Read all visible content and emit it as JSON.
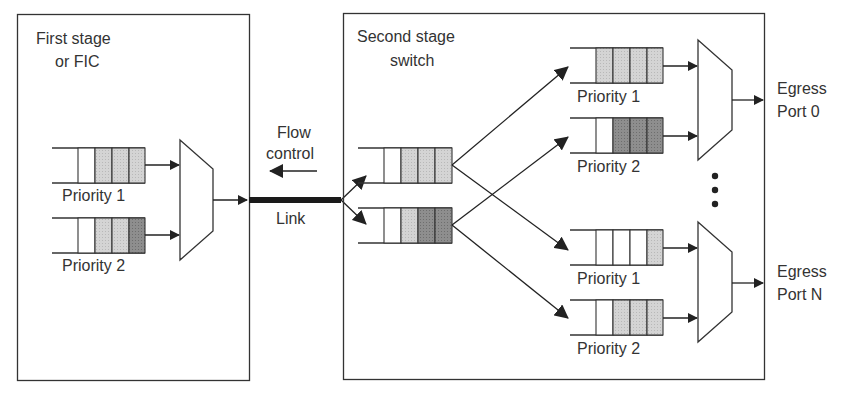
{
  "diagram": {
    "first_stage": {
      "title_line1": "First stage",
      "title_line2": "or FIC",
      "queues": [
        {
          "label": "Priority 1",
          "cells": [
            "empty",
            "light",
            "light",
            "light"
          ]
        },
        {
          "label": "Priority 2",
          "cells": [
            "empty",
            "light",
            "light",
            "dark"
          ]
        }
      ]
    },
    "link": {
      "flow_control_line1": "Flow",
      "flow_control_line2": "control",
      "link_label": "Link"
    },
    "second_stage": {
      "title_line1": "Second stage",
      "title_line2": "switch",
      "input_queues": [
        {
          "cells": [
            "empty",
            "light",
            "light",
            "light"
          ]
        },
        {
          "cells": [
            "empty",
            "light",
            "dark",
            "dark"
          ]
        }
      ],
      "output_groups": [
        {
          "port_label_line1": "Egress",
          "port_label_line2": "Port 0",
          "queues": [
            {
              "label": "Priority 1",
              "cells": [
                "light",
                "light",
                "light",
                "light"
              ]
            },
            {
              "label": "Priority 2",
              "cells": [
                "empty",
                "dark",
                "dark",
                "dark"
              ]
            }
          ]
        },
        {
          "port_label_line1": "Egress",
          "port_label_line2": "Port N",
          "queues": [
            {
              "label": "Priority 1",
              "cells": [
                "empty",
                "empty",
                "empty",
                "light"
              ]
            },
            {
              "label": "Priority 2",
              "cells": [
                "empty",
                "light",
                "light",
                "light"
              ]
            }
          ]
        }
      ],
      "ellipsis": "⋮"
    },
    "colors": {
      "line": "#2a2a2a",
      "light_cell": "#d2d2d2",
      "dark_cell": "#8c8c8c",
      "text": "#333333"
    }
  }
}
